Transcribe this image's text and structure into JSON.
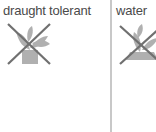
{
  "columns": [
    {
      "label": "draught tolerant",
      "icon": "plant-crossed-icon"
    },
    {
      "label": "water",
      "icon": "plant-crossed-icon"
    }
  ],
  "colors": {
    "text": "#4a4a4a",
    "icon": "#a8a8a8",
    "cross": "#707070",
    "divider": "#c8c8c8"
  }
}
